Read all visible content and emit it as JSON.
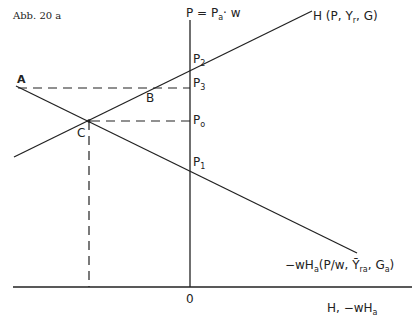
{
  "figure": {
    "caption": "Abb. 20 a",
    "vertical_axis": {
      "label_main": "P = P",
      "label_sub": "a",
      "label_tail": "· w"
    },
    "horizontal_axis": {
      "label": "H,  −wH",
      "label_sub": "a",
      "origin": "0"
    },
    "curves": {
      "H": {
        "label": "H (P, Y",
        "label_sub": "r",
        "label_tail": ", G)"
      },
      "wHa": {
        "label": "−wH",
        "label_sub": "a",
        "label_mid": "(P/w, Ȳ",
        "label_sub2": "ra",
        "label_tail": ", G",
        "label_sub3": "a",
        "label_end": ")"
      }
    },
    "points": {
      "A": "A",
      "B": "B",
      "C": "C"
    },
    "price_levels": [
      {
        "id": "P2",
        "label": "P",
        "sub": "2"
      },
      {
        "id": "P3",
        "label": "P",
        "sub": "3"
      },
      {
        "id": "P0",
        "label": "P",
        "sub": "o"
      },
      {
        "id": "P1",
        "label": "P",
        "sub": "1"
      }
    ]
  }
}
